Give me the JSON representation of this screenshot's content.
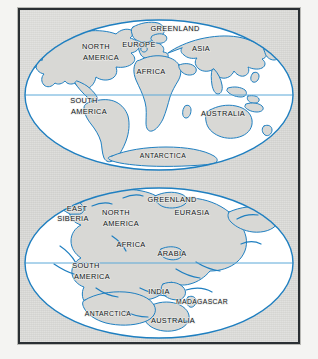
{
  "figure": {
    "background_color": "#d9d9d6",
    "frame_color": "#2a2f33",
    "ocean_color": "#ffffff",
    "land_color": "#d7d7d4",
    "coastline_color": "#1f7fc0",
    "equator_color": "#5aa8d8",
    "label_color": "#14181c"
  },
  "maps": [
    {
      "id": "present-day-map",
      "name": "present-day-world-map",
      "projection": "oval",
      "equator_visible": true,
      "labels": [
        {
          "text": "GREENLAND",
          "x": 175,
          "y": 31
        },
        {
          "text": "EUROPE",
          "x": 139,
          "y": 47
        },
        {
          "text": "NORTH",
          "x": 96,
          "y": 49
        },
        {
          "text": "AMERICA",
          "x": 101,
          "y": 60
        },
        {
          "text": "ASIA",
          "x": 201,
          "y": 51
        },
        {
          "text": "AFRICA",
          "x": 151,
          "y": 74
        },
        {
          "text": "SOUTH",
          "x": 84,
          "y": 103
        },
        {
          "text": "AMERICA",
          "x": 89,
          "y": 114
        },
        {
          "text": "AUSTRALIA",
          "x": 223,
          "y": 116
        },
        {
          "text": "ANTARCTICA",
          "x": 163,
          "y": 158
        }
      ]
    },
    {
      "id": "pangaea-map",
      "name": "supercontinent-reconstruction-map",
      "projection": "oval",
      "equator_visible": true,
      "labels": [
        {
          "text": "GREENLAND",
          "x": 172,
          "y": 202
        },
        {
          "text": "EAST",
          "x": 77,
          "y": 211
        },
        {
          "text": "SIBERIA",
          "x": 73,
          "y": 221
        },
        {
          "text": "NORTH",
          "x": 116,
          "y": 215
        },
        {
          "text": "EURASIA",
          "x": 192,
          "y": 215
        },
        {
          "text": "AMERICA",
          "x": 121,
          "y": 226
        },
        {
          "text": "AFRICA",
          "x": 131,
          "y": 247
        },
        {
          "text": "ARABIA",
          "x": 172,
          "y": 256
        },
        {
          "text": "SOUTH",
          "x": 86,
          "y": 268
        },
        {
          "text": "AMERICA",
          "x": 92,
          "y": 279
        },
        {
          "text": "INDIA",
          "x": 159,
          "y": 294
        },
        {
          "text": "MADAGASCAR",
          "x": 202,
          "y": 304
        },
        {
          "text": "ANTARCTICA",
          "x": 108,
          "y": 316
        },
        {
          "text": "AUSTRALIA",
          "x": 173,
          "y": 323
        }
      ]
    }
  ]
}
